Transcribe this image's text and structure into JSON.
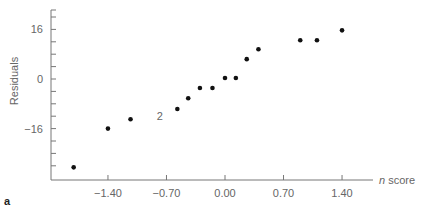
{
  "chart_data": {
    "type": "scatter",
    "title": "",
    "panel_label": "a",
    "xlabel_italic": "n",
    "xlabel": "score",
    "ylabel": "Residuals",
    "xticks": [
      -1.4,
      -0.7,
      0.0,
      0.7,
      1.4
    ],
    "xtick_labels": [
      "-1.40",
      "-0.70",
      "0.00",
      "0.70",
      "1.40"
    ],
    "yticks": [
      16,
      0,
      -16
    ],
    "ytick_labels": [
      "16",
      "0",
      "-16"
    ],
    "xlim": [
      -2.1,
      1.8
    ],
    "ylim": [
      -32,
      22
    ],
    "grid": false,
    "annotations": [
      {
        "text": "2",
        "x": -0.78,
        "y": -12
      }
    ],
    "points": [
      {
        "x": -1.81,
        "y": -28.5
      },
      {
        "x": -1.4,
        "y": -16
      },
      {
        "x": -1.13,
        "y": -13
      },
      {
        "x": -0.57,
        "y": -9.7
      },
      {
        "x": -0.44,
        "y": -6.2
      },
      {
        "x": -0.3,
        "y": -2.9
      },
      {
        "x": -0.15,
        "y": -2.9
      },
      {
        "x": 0.0,
        "y": 0.3
      },
      {
        "x": 0.13,
        "y": 0.3
      },
      {
        "x": 0.26,
        "y": 6.4
      },
      {
        "x": 0.4,
        "y": 9.6
      },
      {
        "x": 0.9,
        "y": 12.5
      },
      {
        "x": 1.1,
        "y": 12.5
      },
      {
        "x": 1.4,
        "y": 15.7
      }
    ]
  },
  "colors": {
    "axis": "#777777",
    "point": "#111111",
    "text": "#666666"
  }
}
